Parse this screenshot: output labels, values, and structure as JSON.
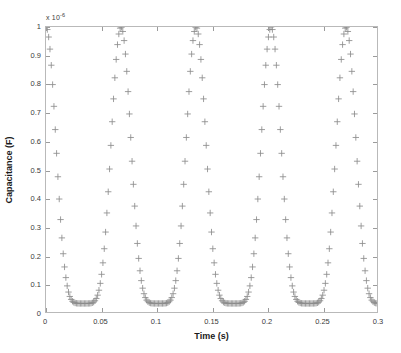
{
  "chart_data": {
    "type": "scatter",
    "title": "",
    "xlabel": "Time (s)",
    "ylabel": "Capacitance (F)",
    "y_exponent_label": "x 10",
    "y_exponent_power": "-6",
    "y_multiplier": 1e-06,
    "xlim": [
      0,
      0.3
    ],
    "ylim": [
      0,
      1.0
    ],
    "xticks": [
      0,
      0.05,
      0.1,
      0.15,
      0.2,
      0.25,
      0.3
    ],
    "xtick_labels": [
      "0",
      "0.05",
      "0.1",
      "0.15",
      "0.2",
      "0.25",
      "0.3"
    ],
    "yticks": [
      0,
      0.1,
      0.2,
      0.3,
      0.4,
      0.5,
      0.6,
      0.7,
      0.8,
      0.9,
      1
    ],
    "ytick_labels": [
      "0",
      "0.1",
      "0.2",
      "0.3",
      "0.4",
      "0.5",
      "0.6",
      "0.7",
      "0.8",
      "0.9",
      "1"
    ],
    "grid": false,
    "legend": null,
    "marker": "plus",
    "marker_color": "#8c8c8c",
    "marker_size": 3.2,
    "axis_color": "#b9b9b9",
    "background_color": "#ffffff",
    "period": 0.068,
    "n_peaks": 5,
    "peak_times": [
      0.0,
      0.068,
      0.136,
      0.204,
      0.272
    ],
    "peak_value": 1.0,
    "min_value": 0.03,
    "sample_step": 0.0012,
    "shape_exponent": 6,
    "series": [
      {
        "name": "Capacitance",
        "description": "Sharply peaked periodic capacitance waveform, normalized peak 1.0 (x 10^-6 F), period 0.068 s"
      }
    ]
  },
  "figure": {
    "x_axis_title": "Time (s)",
    "y_axis_title": "Capacitance (F)"
  }
}
